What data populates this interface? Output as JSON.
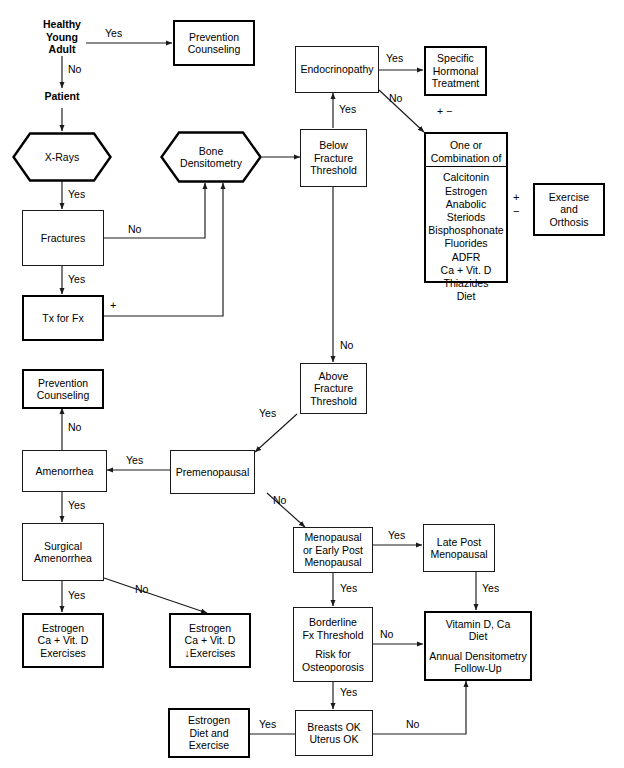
{
  "diagram": {
    "nodes": {
      "healthy_young_adult": "Healthy\nYoung\nAdult",
      "patient": "Patient",
      "prevention_counseling_top": "Prevention\nCounseling",
      "xrays": "X-Rays",
      "fractures": "Fractures",
      "tx_for_fx": "Tx for Fx",
      "bone_densitometry": "Bone\nDensitometry",
      "below_fracture_threshold": "Below\nFracture\nThreshold",
      "endocrinopathy": "Endocrinopathy",
      "specific_hormonal_treatment": "Specific\nHormonal\nTreatment",
      "exercise_and_orthosis": "Exercise\nand\nOrthosis",
      "above_fracture_threshold": "Above\nFracture\nThreshold",
      "prevention_counseling_mid": "Prevention\nCounseling",
      "amenorrhea": "Amenorrhea",
      "premenopausal": "Premenopausal",
      "surgical_amenorrhea": "Surgical\nAmenorrhea",
      "estrogen_exercises": "Estrogen\nCa + Vit. D\nExercises",
      "estrogen_down_exercises": "Estrogen\nCa + Vit. D\n↓Exercises",
      "menopausal_or_early_post": "Menopausal\nor Early Post\nMenopausal",
      "late_post_menopausal": "Late Post\nMenopausal",
      "borderline_line1": "Borderline\nFx Threshold",
      "borderline_line2": "Risk for\nOsteoporosis",
      "vitamin_line1": "Vitamin D, Ca\nDiet",
      "vitamin_line2": "Annual Densitometry\nFollow-Up",
      "breasts_uterus_ok": "Breasts OK\nUterus OK",
      "estrogen_diet_exercise": "Estrogen\nDiet and\nExercise"
    },
    "medication_box": {
      "heading": "One or\nCombination of",
      "items": [
        "Calcitonin",
        "Estrogen",
        "Anabolic Steriods",
        "Bisphosphonate",
        "Fluorides",
        "ADFR",
        "Ca + Vit. D",
        "Thiazides",
        "Diet"
      ]
    },
    "symbols": {
      "plus_minus_above_meds": "+ −",
      "plus_tx_for_fx": "+",
      "plus_exercise": "+",
      "minus_exercise": "−"
    },
    "edge_labels": {
      "healthy_to_prevention": "Yes",
      "healthy_to_patient": "No",
      "xrays_to_fractures": "Yes",
      "fractures_to_densitometry": "No",
      "fractures_to_tx": "Yes",
      "below_to_endocrinopathy": "Yes",
      "endocrinopathy_to_hormonal": "Yes",
      "endocrinopathy_to_meds": "No",
      "below_to_above": "No",
      "above_to_premenopausal": "Yes",
      "premenopausal_to_amenorrhea": "Yes",
      "premenopausal_to_menopausal": "No",
      "amenorrhea_to_prevention": "No",
      "amenorrhea_to_surgical": "Yes",
      "surgical_to_estrogen_ex": "Yes",
      "surgical_to_estrogen_down": "No",
      "menopausal_to_late_post": "Yes",
      "menopausal_to_borderline": "Yes",
      "late_post_to_vitamin": "Yes",
      "borderline_to_vitamin": "No",
      "borderline_to_breasts": "Yes",
      "breasts_to_estrogen_diet": "Yes",
      "breasts_to_vitamin": "No"
    },
    "colors": {
      "line": "#1a1a1a",
      "thick_border": "#000000",
      "background": "#ffffff",
      "text": "#000000"
    }
  }
}
